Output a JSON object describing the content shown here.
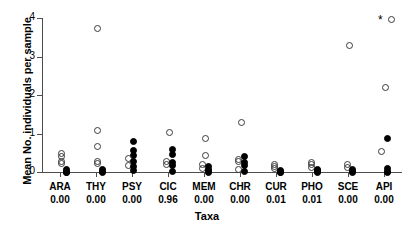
{
  "chart_data": {
    "type": "scatter",
    "title": "",
    "xlabel": "Taxa",
    "ylabel": "Mean No. individuals per sample",
    "ylim": [
      0,
      4
    ],
    "yticks": [
      0,
      1,
      2,
      3,
      4
    ],
    "grid": false,
    "legend": null,
    "annotations": [
      {
        "text": "*",
        "category": "API",
        "y": 3.95,
        "note": "significance marker above API"
      }
    ],
    "marker_types": {
      "open": "open circle",
      "closed": "filled circle",
      "star": "asterisk significance marker"
    },
    "categories": [
      "ARA",
      "THY",
      "PSY",
      "CIC",
      "MEM",
      "CHR",
      "CUR",
      "PHO",
      "SCE",
      "API"
    ],
    "category_values": [
      "0.00",
      "0.00",
      "0.00",
      "0.96",
      "0.00",
      "0.00",
      "0.01",
      "0.01",
      "0.00",
      "0.00"
    ],
    "series": [
      {
        "name": "ARA",
        "points": [
          {
            "y": 0.5,
            "marker": "open",
            "dx": 0
          },
          {
            "y": 0.43,
            "marker": "open",
            "dx": 0
          },
          {
            "y": 0.3,
            "marker": "open",
            "dx": 0
          },
          {
            "y": 0.24,
            "marker": "open",
            "dx": 0
          },
          {
            "y": 0.1,
            "marker": "closed",
            "dx": 5
          },
          {
            "y": 0.05,
            "marker": "closed",
            "dx": 5
          },
          {
            "y": 0.02,
            "marker": "closed",
            "dx": 5
          },
          {
            "y": 0.01,
            "marker": "closed",
            "dx": 5
          }
        ]
      },
      {
        "name": "THY",
        "points": [
          {
            "y": 3.76,
            "marker": "open",
            "dx": 0
          },
          {
            "y": 1.1,
            "marker": "open",
            "dx": 0
          },
          {
            "y": 0.7,
            "marker": "open",
            "dx": 0
          },
          {
            "y": 0.3,
            "marker": "open",
            "dx": 0
          },
          {
            "y": 0.24,
            "marker": "open",
            "dx": 0
          },
          {
            "y": 0.08,
            "marker": "closed",
            "dx": 5
          },
          {
            "y": 0.04,
            "marker": "closed",
            "dx": 5
          },
          {
            "y": 0.01,
            "marker": "closed",
            "dx": 5
          }
        ]
      },
      {
        "name": "PSY",
        "points": [
          {
            "y": 0.82,
            "marker": "closed",
            "dx": 0
          },
          {
            "y": 0.58,
            "marker": "closed",
            "dx": 0
          },
          {
            "y": 0.45,
            "marker": "closed",
            "dx": 0
          },
          {
            "y": 0.38,
            "marker": "open",
            "dx": -5
          },
          {
            "y": 0.3,
            "marker": "closed",
            "dx": 0
          },
          {
            "y": 0.2,
            "marker": "open",
            "dx": -5
          },
          {
            "y": 0.18,
            "marker": "closed",
            "dx": 0
          },
          {
            "y": 0.06,
            "marker": "closed",
            "dx": 0
          }
        ]
      },
      {
        "name": "CIC",
        "points": [
          {
            "y": 1.05,
            "marker": "open",
            "dx": 0
          },
          {
            "y": 0.62,
            "marker": "closed",
            "dx": 3
          },
          {
            "y": 0.48,
            "marker": "closed",
            "dx": 3
          },
          {
            "y": 0.3,
            "marker": "open",
            "dx": -3
          },
          {
            "y": 0.26,
            "marker": "closed",
            "dx": 3
          },
          {
            "y": 0.22,
            "marker": "open",
            "dx": -3
          },
          {
            "y": 0.2,
            "marker": "closed",
            "dx": 3
          },
          {
            "y": 0.04,
            "marker": "closed",
            "dx": 3
          }
        ]
      },
      {
        "name": "MEM",
        "points": [
          {
            "y": 0.9,
            "marker": "open",
            "dx": 0
          },
          {
            "y": 0.45,
            "marker": "open",
            "dx": 0
          },
          {
            "y": 0.22,
            "marker": "open",
            "dx": -3
          },
          {
            "y": 0.16,
            "marker": "closed",
            "dx": 3
          },
          {
            "y": 0.12,
            "marker": "open",
            "dx": -3
          },
          {
            "y": 0.08,
            "marker": "closed",
            "dx": 3
          },
          {
            "y": 0.04,
            "marker": "closed",
            "dx": 3
          },
          {
            "y": 0.01,
            "marker": "closed",
            "dx": 3
          }
        ]
      },
      {
        "name": "CHR",
        "points": [
          {
            "y": 1.3,
            "marker": "open",
            "dx": 0
          },
          {
            "y": 0.42,
            "marker": "closed",
            "dx": 3
          },
          {
            "y": 0.36,
            "marker": "open",
            "dx": -3
          },
          {
            "y": 0.3,
            "marker": "open",
            "dx": -3
          },
          {
            "y": 0.26,
            "marker": "closed",
            "dx": 3
          },
          {
            "y": 0.2,
            "marker": "closed",
            "dx": 3
          },
          {
            "y": 0.1,
            "marker": "open",
            "dx": -3
          },
          {
            "y": 0.03,
            "marker": "closed",
            "dx": 3
          }
        ]
      },
      {
        "name": "CUR",
        "points": [
          {
            "y": 0.22,
            "marker": "open",
            "dx": -3
          },
          {
            "y": 0.16,
            "marker": "open",
            "dx": -3
          },
          {
            "y": 0.11,
            "marker": "open",
            "dx": -3
          },
          {
            "y": 0.07,
            "marker": "closed",
            "dx": 3
          },
          {
            "y": 0.04,
            "marker": "closed",
            "dx": 3
          },
          {
            "y": 0.02,
            "marker": "closed",
            "dx": 3
          },
          {
            "y": 0.01,
            "marker": "closed",
            "dx": 3
          }
        ]
      },
      {
        "name": "PHO",
        "points": [
          {
            "y": 0.28,
            "marker": "open",
            "dx": -2
          },
          {
            "y": 0.22,
            "marker": "open",
            "dx": -2
          },
          {
            "y": 0.14,
            "marker": "open",
            "dx": -2
          },
          {
            "y": 0.1,
            "marker": "closed",
            "dx": 4
          },
          {
            "y": 0.06,
            "marker": "closed",
            "dx": 4
          },
          {
            "y": 0.03,
            "marker": "closed",
            "dx": 4
          },
          {
            "y": 0.01,
            "marker": "closed",
            "dx": 4
          }
        ]
      },
      {
        "name": "SCE",
        "points": [
          {
            "y": 3.3,
            "marker": "open",
            "dx": 0
          },
          {
            "y": 0.22,
            "marker": "open",
            "dx": -2
          },
          {
            "y": 0.15,
            "marker": "open",
            "dx": -2
          },
          {
            "y": 0.08,
            "marker": "closed",
            "dx": 3
          },
          {
            "y": 0.04,
            "marker": "closed",
            "dx": 3
          },
          {
            "y": 0.01,
            "marker": "closed",
            "dx": 3
          }
        ]
      },
      {
        "name": "API",
        "points": [
          {
            "y": 4.0,
            "marker": "open",
            "dx": 6
          },
          {
            "y": 2.22,
            "marker": "open",
            "dx": 0
          },
          {
            "y": 0.9,
            "marker": "closed",
            "dx": 2
          },
          {
            "y": 0.55,
            "marker": "open",
            "dx": -4
          },
          {
            "y": 0.12,
            "marker": "closed",
            "dx": 2
          },
          {
            "y": 0.05,
            "marker": "closed",
            "dx": 2
          },
          {
            "y": 0.01,
            "marker": "closed",
            "dx": 2
          }
        ]
      }
    ]
  }
}
